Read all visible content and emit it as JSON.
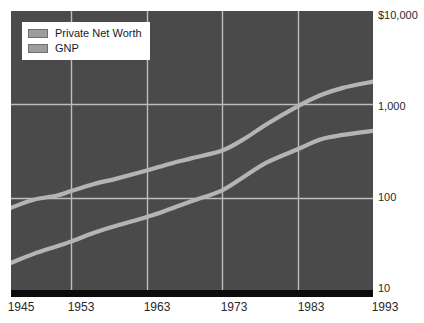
{
  "chart_data": {
    "type": "line",
    "title": "",
    "subtitle": "",
    "xlabel": "",
    "ylabel": "",
    "yscale": "log",
    "ylim": [
      10,
      10000
    ],
    "xlim": [
      1945,
      1993
    ],
    "grid": true,
    "legend_position": "top-left",
    "y_ticks": [
      {
        "label": "$10,000",
        "value": 10000
      },
      {
        "label": "1,000",
        "value": 1000
      },
      {
        "label": "100",
        "value": 100
      },
      {
        "label": "10",
        "value": 10
      }
    ],
    "x_ticks": [
      {
        "label": "1945",
        "value": 1945
      },
      {
        "label": "1953",
        "value": 1953
      },
      {
        "label": "1963",
        "value": 1963
      },
      {
        "label": "1973",
        "value": 1973
      },
      {
        "label": "1983",
        "value": 1983
      },
      {
        "label": "1993",
        "value": 1993
      }
    ],
    "x_gridlines": [
      1953,
      1963,
      1973,
      1983
    ],
    "y_gridlines": [
      1000,
      100
    ],
    "categories": [
      1945,
      1948,
      1951,
      1953,
      1956,
      1959,
      1963,
      1966,
      1969,
      1973,
      1976,
      1979,
      1983,
      1986,
      1989,
      1993
    ],
    "series": [
      {
        "name": "Private Net Worth",
        "color": "#b4b4b4",
        "values": [
          78,
          95,
          105,
          118,
          140,
          160,
          195,
          230,
          265,
          320,
          430,
          620,
          950,
          1250,
          1500,
          1750
        ]
      },
      {
        "name": "GNP",
        "color": "#b4b4b4",
        "values": [
          20,
          25,
          30,
          34,
          42,
          50,
          62,
          75,
          92,
          120,
          170,
          240,
          330,
          420,
          470,
          520
        ]
      }
    ]
  },
  "legend": {
    "items": [
      {
        "label": "Private Net Worth",
        "swatch_color": "#9d9d9d"
      },
      {
        "label": "GNP",
        "swatch_color": "#9d9d9d"
      }
    ]
  },
  "colors": {
    "plot_background": "#4a4a4a",
    "gridline": "#bdbdbd",
    "line": "#b4b4b4",
    "baseline_bar": "#0b0b0b",
    "page_background": "#ffffff",
    "tick_text": "#2a2a2a"
  }
}
